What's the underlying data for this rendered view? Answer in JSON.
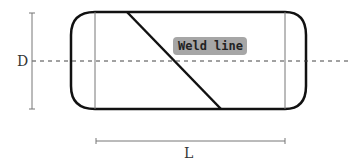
{
  "diagram": {
    "type": "pressure-vessel-schematic",
    "labels": {
      "diameter": "D",
      "length": "L",
      "weld": "Weld line"
    },
    "colors": {
      "outline": "#111111",
      "dimension": "#666666",
      "centerline": "#444444",
      "weld_label_bg": "#a6a6a6",
      "weld_label_text": "#222222"
    }
  }
}
